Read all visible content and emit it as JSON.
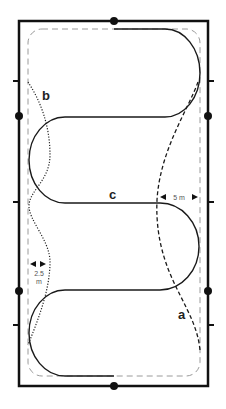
{
  "diagram": {
    "colors": {
      "border": "#111111",
      "marker": "#111111",
      "track": "#9a9a9a",
      "path": "#1a1a1a",
      "label": "#222222",
      "measure": "#555555"
    },
    "labels": {
      "a": "a",
      "b": "b",
      "c": "c"
    },
    "measurements": {
      "right": "5 m",
      "left_value": "2.5",
      "left_unit": "m"
    },
    "paths": [
      {
        "id": "a",
        "style": "dashed",
        "description": "Serpentine along long side, curving off the track"
      },
      {
        "id": "b",
        "style": "dotted",
        "description": "Shallow serpentine along long side, 2.5 m off the track"
      },
      {
        "id": "c",
        "style": "solid",
        "description": "Four-loop serpentine across the arena"
      }
    ],
    "markers": {
      "dots": 6,
      "ticks": 6
    }
  }
}
